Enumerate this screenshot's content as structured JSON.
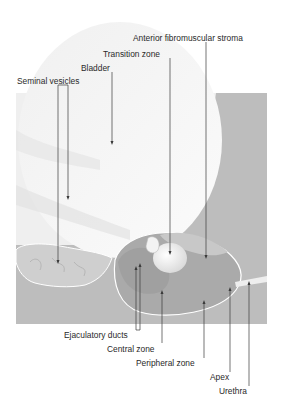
{
  "figure": {
    "type": "anatomical-diagram",
    "colors": {
      "background": "#ffffff",
      "panel_gray": "#bdbdbd",
      "bladder_white": "#f7f7f7",
      "prostate_gray": "#a9a9a9",
      "outline_white": "#ffffff",
      "leader_line": "#3a3a3a",
      "label_text": "#2a2a2a"
    }
  },
  "labels": {
    "anterior_fibromuscular_stroma": "Anterior fibromuscular stroma",
    "transition_zone": "Transition zone",
    "bladder": "Bladder",
    "seminal_vesicles": "Seminal vesicles",
    "ejaculatory_ducts": "Ejaculatory ducts",
    "central_zone": "Central zone",
    "peripheral_zone": "Peripheral zone",
    "apex": "Apex",
    "urethra": "Urethra"
  }
}
